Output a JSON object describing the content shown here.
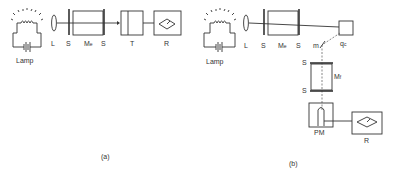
{
  "figure_a": {
    "caption": "(a)",
    "lamp_label": "Lamp",
    "lens_label": "L",
    "slit_left_label": "S",
    "mono_label": "M",
    "mono_sub": "e",
    "slit_right_label": "S",
    "target_label": "T",
    "recorder_label": "R"
  },
  "figure_b": {
    "caption": "(b)",
    "lamp_label": "Lamp",
    "lens_label": "L",
    "slit_left_label": "S",
    "mono_label": "M",
    "mono_sub": "e",
    "slit_right_label": "S",
    "quantum_counter_label": "q",
    "quantum_counter_sub": "c",
    "mirror_label": "m",
    "slit_top_label": "S",
    "mono2_label": "M",
    "mono2_sub": "f",
    "slit_bottom_label": "S",
    "photomultiplier_label": "PM",
    "recorder_label": "R"
  }
}
